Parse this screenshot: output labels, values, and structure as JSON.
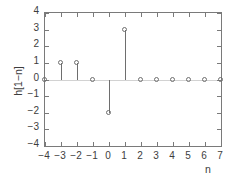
{
  "chart_data": {
    "type": "scatter",
    "plot_style": "stem",
    "title": "",
    "xlabel": "n",
    "ylabel": "h[1−n]",
    "x": [
      -4,
      -3,
      -2,
      -1,
      0,
      1,
      2,
      3,
      4,
      5,
      6,
      7
    ],
    "values": [
      0,
      1,
      1,
      0,
      -2,
      3,
      0,
      0,
      0,
      0,
      0,
      0
    ],
    "xlim": [
      -4,
      7
    ],
    "ylim": [
      -4,
      4
    ],
    "xticks": [
      -4,
      -3,
      -2,
      -1,
      0,
      1,
      2,
      3,
      4,
      5,
      6,
      7
    ],
    "yticks": [
      4,
      3,
      2,
      1,
      0,
      -1,
      -2,
      -3,
      -4
    ],
    "xticklabels": [
      "−4",
      "−3",
      "−2",
      "−1",
      "0",
      "1",
      "2",
      "3",
      "4",
      "5",
      "6",
      "7"
    ],
    "yticklabels": [
      "4",
      "3",
      "2",
      "1",
      "0",
      "−1",
      "−2",
      "−3",
      "−4"
    ],
    "grid": false,
    "legend": null,
    "baseline": 0,
    "colors": {
      "axis": "#7a7a7a",
      "marker": "#6e6e6e",
      "stem": "#6e6e6e",
      "baseline": "#d2d2d2",
      "text": "#3d3d3d",
      "background": "#ffffff"
    }
  }
}
